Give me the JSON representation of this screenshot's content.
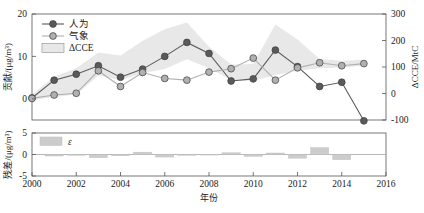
{
  "chart_data": {
    "type": "line",
    "title": "",
    "xlabel": "年份",
    "ylabel_left": "贡献/(μg/m³)",
    "ylabel_right": "ΔCCE/MtC",
    "xlim": [
      2000,
      2016
    ],
    "xticks": [
      2000,
      2002,
      2004,
      2006,
      2008,
      2010,
      2012,
      2014,
      2016
    ],
    "xticklabels": [
      "2000",
      "2002",
      "2004",
      "2006",
      "2008",
      "2010",
      "2012",
      "2014",
      "2016"
    ],
    "ylim_left": [
      -5,
      20
    ],
    "yticks_left": [
      0,
      10,
      20
    ],
    "yticklabels_left": [
      "0",
      "10",
      "20"
    ],
    "ylim_right": [
      -100,
      300
    ],
    "yticks_right": [
      -100,
      0,
      100,
      200,
      300
    ],
    "yticklabels_right": [
      "-100",
      "0",
      "100",
      "200",
      "300"
    ],
    "grid": false,
    "legend_position": "upper-left",
    "x": [
      2000,
      2001,
      2002,
      2003,
      2004,
      2005,
      2006,
      2007,
      2008,
      2009,
      2010,
      2011,
      2012,
      2013,
      2014,
      2015
    ],
    "series": [
      {
        "name": "人为",
        "marker": "circle",
        "color": "#5a5a5a",
        "values": [
          0.2,
          4.4,
          5.8,
          7.8,
          5.1,
          7.0,
          10.0,
          13.3,
          10.7,
          4.2,
          4.7,
          11.5,
          7.6,
          2.9,
          3.9,
          -5.2
        ]
      },
      {
        "name": "气象",
        "marker": "circle",
        "color": "#b0b0b0",
        "values": [
          0.1,
          0.9,
          1.3,
          6.6,
          2.9,
          6.2,
          4.8,
          4.4,
          6.3,
          7.1,
          9.6,
          4.4,
          7.3,
          8.5,
          7.8,
          8.3
        ]
      }
    ],
    "band": {
      "name": "ΔCCE",
      "color": "#e8e8e8",
      "upper": [
        1.0,
        5.2,
        7.2,
        10.9,
        10.2,
        13.7,
        16.4,
        18.0,
        12.3,
        8.1,
        8.2,
        17.5,
        14.0,
        9.4,
        9.0,
        9.2
      ],
      "lower": [
        -0.3,
        0.4,
        1.0,
        5.5,
        4.4,
        6.0,
        7.0,
        9.3,
        7.2,
        4.5,
        4.2,
        5.6,
        6.6,
        7.2,
        7.4,
        7.8
      ]
    },
    "residual_panel": {
      "ylabel": "残差/(μg/m³)",
      "ylim": [
        -5,
        5
      ],
      "yticks": [
        -5,
        0,
        5
      ],
      "yticklabels": [
        "-5",
        "0",
        "5"
      ],
      "legend_label": "ε",
      "color": "#cccccc",
      "x": [
        2000,
        2001,
        2002,
        2003,
        2004,
        2005,
        2006,
        2007,
        2008,
        2009,
        2010,
        2011,
        2012,
        2013,
        2014,
        2015
      ],
      "values": [
        0.0,
        -0.35,
        -0.1,
        -0.75,
        -0.3,
        0.55,
        -0.6,
        -0.1,
        0.05,
        0.4,
        -0.45,
        0.35,
        -0.85,
        1.6,
        -1.2,
        0.0
      ]
    }
  }
}
